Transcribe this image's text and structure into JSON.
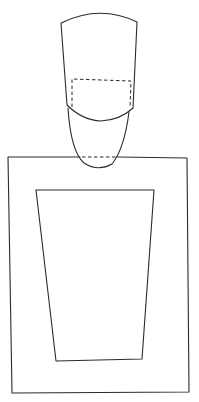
{
  "figure": {
    "stroke_color": "#2b2b2b",
    "background": "#ffffff",
    "shapes": {
      "upper_cap": {
        "label": "upper cap outline"
      },
      "dashed_band": {
        "label": "dashed inner rectangle"
      },
      "lower_lobe": {
        "label": "lower rounded lobe"
      },
      "neck_dash": {
        "label": "dashed line at rectangle top edge"
      },
      "outer_rect": {
        "label": "outer rectangle"
      },
      "inner_trapezoid": {
        "label": "inner tapered frame"
      }
    }
  }
}
